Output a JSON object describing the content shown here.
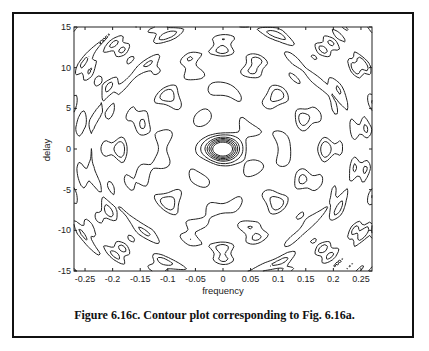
{
  "chart_data": {
    "type": "contour",
    "title": "",
    "xlabel": "frequency",
    "ylabel": "delay",
    "xlim": [
      -0.27,
      0.27
    ],
    "ylim": [
      -15,
      15
    ],
    "x_ticks": [
      -0.25,
      -0.2,
      -0.15,
      -0.1,
      -0.05,
      0,
      0.05,
      0.1,
      0.15,
      0.2,
      0.25
    ],
    "x_tick_labels": [
      "-0.25",
      "-0.2",
      "-0.15",
      "-0.1",
      "-0.05",
      "0",
      "0.05",
      "0.1",
      "0.15",
      "0.2",
      "0.25"
    ],
    "y_ticks": [
      15,
      10,
      5,
      0,
      -5,
      -10,
      -15
    ],
    "y_tick_labels": [
      "15",
      "10",
      "5",
      "0",
      "-5",
      "-10",
      "-15"
    ],
    "grid": false,
    "legend": null,
    "features": {
      "central_peak": {
        "frequency": 0,
        "delay": 0,
        "description": "dense concentric contours (main lobe)"
      },
      "symmetry": "symmetric about frequency=0 and delay=0",
      "side_lobes": [
        {
          "frequency": -0.18,
          "delay": 1.5
        },
        {
          "frequency": 0.18,
          "delay": 1.5
        },
        {
          "frequency": -0.18,
          "delay": -1.5
        },
        {
          "frequency": 0.18,
          "delay": -1.5
        },
        {
          "frequency": -0.1,
          "delay": 4
        },
        {
          "frequency": 0.1,
          "delay": 4
        },
        {
          "frequency": -0.1,
          "delay": -4
        },
        {
          "frequency": 0.1,
          "delay": -4
        }
      ]
    }
  },
  "caption": "Figure 6.16c. Contour plot corresponding to Fig. 6.16a."
}
